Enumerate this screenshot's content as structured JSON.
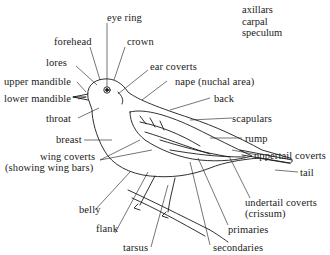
{
  "diagram": {
    "type": "labeled-illustration",
    "legend_terms": [
      "axillars",
      "carpal",
      "speculum"
    ],
    "labels": {
      "eye_ring": "eye ring",
      "forehead": "forehead",
      "crown": "crown",
      "lores": "lores",
      "ear_coverts": "ear coverts",
      "upper_mandible": "upper mandible",
      "lower_mandible": "lower mandible",
      "nape": "nape (nuchal area)",
      "back": "back",
      "throat": "throat",
      "scapulars": "scapulars",
      "breast": "breast",
      "rump": "rump",
      "wing_coverts_1": "wing coverts",
      "wing_coverts_2": "(showing wing bars)",
      "uppertail_coverts": "uppertail coverts",
      "tail": "tail",
      "belly": "belly",
      "undertail_coverts_1": "undertail coverts",
      "undertail_coverts_2": "(crissum)",
      "flank": "flank",
      "primaries": "primaries",
      "tarsus": "tarsus",
      "secondaries": "secondaries"
    },
    "colors": {
      "ink": "#1a1a1a",
      "background": "#ffffff"
    }
  }
}
